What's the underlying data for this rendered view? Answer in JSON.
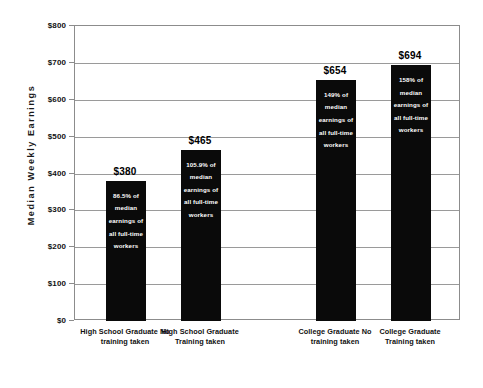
{
  "chart_data": {
    "type": "bar",
    "title": "",
    "xlabel": "",
    "ylabel": "Median Weekly Earnings",
    "ylim": [
      0,
      800
    ],
    "ytick_values": [
      800,
      700,
      600,
      500,
      400,
      300,
      200,
      100,
      0
    ],
    "ytick_labels": [
      "$800",
      "$700",
      "$600",
      "$500",
      "$400",
      "$300",
      "$200",
      "$100",
      "$0"
    ],
    "grid": true,
    "legend": "none",
    "categories": [
      "High School Graduate No training taken",
      "High School Graduate Training taken",
      "College Graduate No training taken",
      "College Graduate Training taken"
    ],
    "values": [
      380,
      465,
      654,
      694
    ],
    "value_labels": [
      "$380",
      "$465",
      "$654",
      "$694"
    ],
    "bar_color": "#0a0a0a",
    "annotations": [
      "86.5% of median earnings of all full-time workers",
      "105.9% of median earnings of all full-time workers",
      "149% of median earnings of all full-time workers",
      "158% of median earnings of all full-time workers"
    ]
  },
  "axis": {
    "y_title": "Median Weekly Earnings",
    "ticks": [
      {
        "label": "$800"
      },
      {
        "label": "$700"
      },
      {
        "label": "$600"
      },
      {
        "label": "$500"
      },
      {
        "label": "$400"
      },
      {
        "label": "$300"
      },
      {
        "label": "$200"
      },
      {
        "label": "$100"
      },
      {
        "label": "$0"
      }
    ]
  },
  "bars": [
    {
      "value_label": "$380",
      "inner_text": "86.5% of median earnings of all full-time workers",
      "category_label": "High School Graduate No training taken"
    },
    {
      "value_label": "$465",
      "inner_text": "105.9% of median earnings of all full-time workers",
      "category_label": "High School Graduate Training taken"
    },
    {
      "value_label": "$654",
      "inner_text": "149% of median earnings of all full-time workers",
      "category_label": "College Graduate No training taken"
    },
    {
      "value_label": "$694",
      "inner_text": "158% of median earnings of all full-time workers",
      "category_label": "College Graduate Training taken"
    }
  ]
}
